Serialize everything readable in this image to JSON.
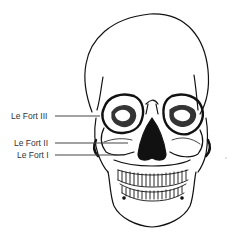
{
  "diagram": {
    "labels": [
      {
        "id": "le-fort-iii",
        "text": "Le Fort III",
        "x": 11,
        "y": 111,
        "line_to_x": 100,
        "line_y": 116
      },
      {
        "id": "le-fort-ii",
        "text": "Le Fort II",
        "x": 14,
        "y": 138,
        "line_to_x": 128,
        "line_y": 143
      },
      {
        "id": "le-fort-i",
        "text": "Le Fort I",
        "x": 17,
        "y": 150,
        "line_to_x": 125,
        "line_y": 155
      }
    ],
    "colors": {
      "stroke": "#111111",
      "label_text": "#333333",
      "leader_line": "#444444",
      "background": "#ffffff"
    }
  }
}
